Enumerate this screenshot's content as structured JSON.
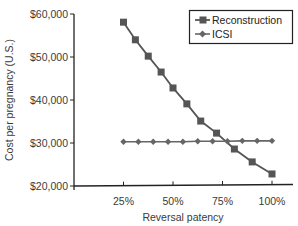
{
  "chart_data": {
    "type": "line",
    "title": "",
    "xlabel": "Reversal patency",
    "ylabel": "Cost per pregnancy (U.S.)",
    "xlim": [
      0,
      100
    ],
    "ylim": [
      20000,
      60000
    ],
    "x_ticks": [
      25,
      50,
      75,
      100
    ],
    "x_tick_labels": [
      "25%",
      "50%",
      "75%",
      "100%"
    ],
    "y_ticks": [
      20000,
      30000,
      40000,
      50000,
      60000
    ],
    "y_tick_labels": [
      "$20,000",
      "$30,000",
      "$40,000",
      "$50,000",
      "$60,000"
    ],
    "grid": false,
    "legend_position": "upper right",
    "series": [
      {
        "name": "Reconstruction",
        "marker": "square",
        "color": "#555555",
        "x": [
          25,
          31,
          37.5,
          44,
          50,
          57,
          64,
          72,
          81,
          90,
          100
        ],
        "values": [
          58100,
          54000,
          50200,
          46500,
          42800,
          39100,
          35100,
          32300,
          28600,
          25600,
          22800
        ]
      },
      {
        "name": "ICSI",
        "marker": "diamond",
        "color": "#666666",
        "x": [
          25,
          32.5,
          40,
          47.5,
          55,
          62.5,
          70,
          77.5,
          85,
          92.5,
          100
        ],
        "values": [
          30300,
          30300,
          30300,
          30300,
          30300,
          30400,
          30400,
          30400,
          30500,
          30500,
          30500
        ]
      }
    ]
  },
  "legend": {
    "items": [
      "Reconstruction",
      "ICSI"
    ]
  },
  "axes": {
    "x_title": "Reversal patency",
    "y_title": "Cost per pregnancy (U.S.)"
  }
}
